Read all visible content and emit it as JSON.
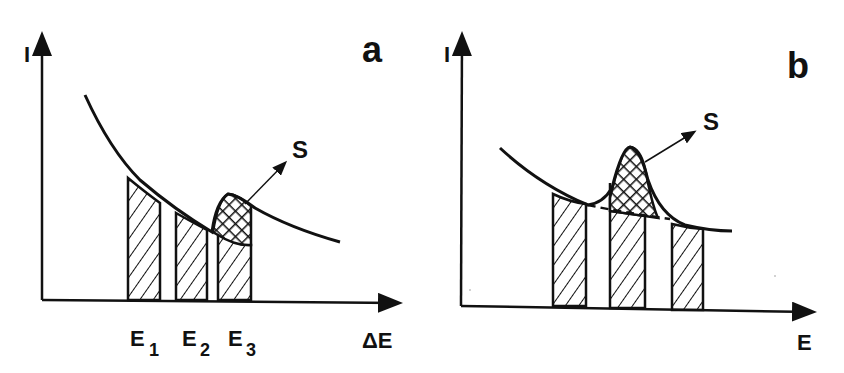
{
  "panels": {
    "a": {
      "panel_label": "a",
      "y_axis_label": "I",
      "x_axis_label": "ΔE",
      "peak_label": "S",
      "windows": [
        {
          "name": "E",
          "sub": "1"
        },
        {
          "name": "E",
          "sub": "2"
        },
        {
          "name": "E",
          "sub": "3"
        }
      ]
    },
    "b": {
      "panel_label": "b",
      "y_axis_label": "I",
      "x_axis_label": "E",
      "peak_label": "S"
    }
  },
  "colors": {
    "ink": "#111111",
    "background": "#ffffff"
  }
}
